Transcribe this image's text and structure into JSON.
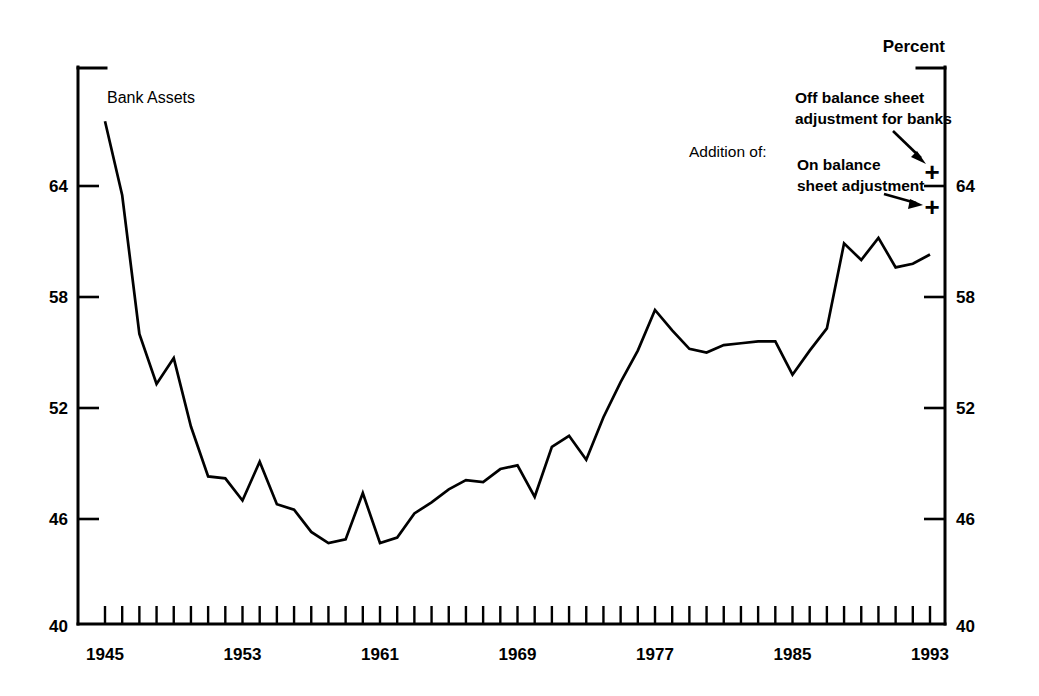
{
  "chart_data": {
    "type": "line",
    "title": "",
    "xlabel": "",
    "ylabel": "Percent",
    "unit_label": "Percent",
    "xlim": [
      1945,
      1994
    ],
    "ylim": [
      40,
      68
    ],
    "ytick_labels": [
      "40",
      "46",
      "52",
      "58",
      "64"
    ],
    "ytick_values": [
      40,
      46,
      52,
      58,
      64
    ],
    "xtick_labels": [
      "1945",
      "1953",
      "1961",
      "1969",
      "1977",
      "1985",
      "1993"
    ],
    "xtick_values": [
      1945,
      1953,
      1961,
      1969,
      1977,
      1985,
      1993
    ],
    "minor_xticks_every": 1,
    "grid": false,
    "legend_position": "inline-label",
    "series": [
      {
        "name": "Bank Assets",
        "label": "Bank Assets",
        "color": "#000000",
        "x": [
          1945,
          1946,
          1947,
          1948,
          1949,
          1950,
          1951,
          1952,
          1953,
          1954,
          1955,
          1956,
          1957,
          1958,
          1959,
          1960,
          1961,
          1962,
          1963,
          1964,
          1965,
          1966,
          1967,
          1968,
          1969,
          1970,
          1971,
          1972,
          1973,
          1974,
          1975,
          1976,
          1977,
          1978,
          1979,
          1980,
          1981,
          1982,
          1983,
          1984,
          1985,
          1986,
          1987,
          1988,
          1989,
          1990,
          1991,
          1992,
          1993
        ],
        "y": [
          67.5,
          63.5,
          56.0,
          53.3,
          54.7,
          51.0,
          48.3,
          48.2,
          47.0,
          49.1,
          46.8,
          46.5,
          45.3,
          44.7,
          44.9,
          47.4,
          44.7,
          45.0,
          46.3,
          46.9,
          47.6,
          48.1,
          48.0,
          48.7,
          48.9,
          47.2,
          49.9,
          50.5,
          49.2,
          51.5,
          53.4,
          55.1,
          57.3,
          56.2,
          55.2,
          55.0,
          55.4,
          55.5,
          55.6,
          55.6,
          53.8,
          55.1,
          56.3,
          60.9,
          60.0,
          61.2,
          59.6,
          59.8,
          60.3
        ]
      }
    ],
    "annotations": [
      {
        "id": "addition-of",
        "text": "Addition of:",
        "bold": false
      },
      {
        "id": "off-balance-sheet",
        "text_line1": "Off balance sheet",
        "text_line2": "adjustment for banks",
        "marker": "+",
        "marker_value_year": 1993,
        "marker_value_y": 64.8,
        "bold": true
      },
      {
        "id": "on-balance-sheet",
        "text_line1": "On balance",
        "text_line2": "sheet adjustment",
        "marker": "+",
        "marker_value_year": 1993,
        "marker_value_y": 62.9,
        "bold": true
      }
    ]
  },
  "labels": {
    "series_label": "Bank Assets",
    "unit_top_right": "Percent",
    "addition_of": "Addition of:",
    "off_balance_line1": "Off balance sheet",
    "off_balance_line2": "adjustment for banks",
    "on_balance_line1": "On balance",
    "on_balance_line2": "sheet adjustment",
    "plus_off": "+",
    "plus_on": "+",
    "y_left": [
      "64",
      "58",
      "52",
      "46",
      "40"
    ],
    "y_right": [
      "64",
      "58",
      "52",
      "46",
      "40"
    ],
    "x_ticks": [
      "1945",
      "1953",
      "1961",
      "1969",
      "1977",
      "1985",
      "1993"
    ]
  },
  "colors": {
    "line": "#000000",
    "axis": "#000000",
    "background": "#ffffff"
  }
}
